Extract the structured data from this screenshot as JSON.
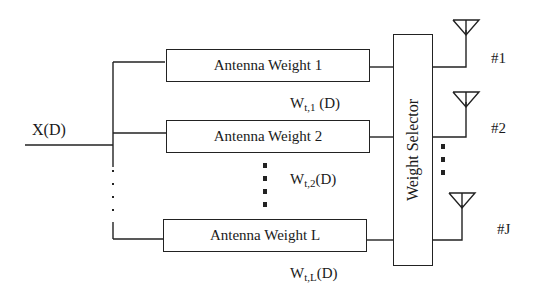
{
  "input": {
    "label": "X(D)"
  },
  "weights": [
    {
      "box_label": "Antenna Weight 1",
      "weight_main": "W",
      "weight_sub": "t,1",
      "weight_arg": " (D)"
    },
    {
      "box_label": "Antenna Weight 2",
      "weight_main": "W",
      "weight_sub": "t,2",
      "weight_arg": "(D)"
    },
    {
      "box_label": "Antenna Weight L",
      "weight_main": "W",
      "weight_sub": "t,L",
      "weight_arg": "(D)"
    }
  ],
  "selector": {
    "label": "Weight Selector"
  },
  "antennas": [
    {
      "label": "#1"
    },
    {
      "label": "#2"
    },
    {
      "label": "#J"
    }
  ],
  "colors": {
    "line": "#222222",
    "background": "#ffffff"
  }
}
